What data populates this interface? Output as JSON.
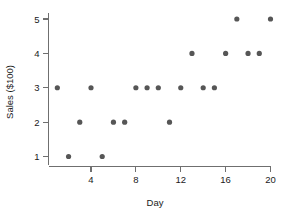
{
  "chart_data": {
    "type": "scatter",
    "title": "",
    "xlabel": "Day",
    "ylabel": "Sales ($100)",
    "x": [
      1,
      2,
      3,
      4,
      5,
      6,
      7,
      8,
      9,
      10,
      11,
      12,
      13,
      14,
      15,
      16,
      17,
      18,
      19,
      20
    ],
    "values": [
      3,
      1,
      2,
      3,
      1,
      2,
      2,
      3,
      3,
      3,
      2,
      3,
      4,
      3,
      3,
      4,
      5,
      4,
      4,
      5
    ],
    "points": [
      {
        "x": 1,
        "y": 3
      },
      {
        "x": 2,
        "y": 1
      },
      {
        "x": 3,
        "y": 2
      },
      {
        "x": 4,
        "y": 3
      },
      {
        "x": 5,
        "y": 1
      },
      {
        "x": 6,
        "y": 2
      },
      {
        "x": 7,
        "y": 2
      },
      {
        "x": 8,
        "y": 3
      },
      {
        "x": 9,
        "y": 3
      },
      {
        "x": 10,
        "y": 3
      },
      {
        "x": 11,
        "y": 2
      },
      {
        "x": 12,
        "y": 3
      },
      {
        "x": 13,
        "y": 4
      },
      {
        "x": 14,
        "y": 3
      },
      {
        "x": 15,
        "y": 3
      },
      {
        "x": 16,
        "y": 4
      },
      {
        "x": 17,
        "y": 5
      },
      {
        "x": 18,
        "y": 4
      },
      {
        "x": 19,
        "y": 4
      },
      {
        "x": 20,
        "y": 5
      }
    ],
    "xlim": [
      0.4,
      20.4
    ],
    "ylim": [
      0.55,
      5.45
    ],
    "xticks": [
      4,
      8,
      12,
      16,
      20
    ],
    "xticklabels": [
      "4",
      "8",
      "12",
      "16",
      "20"
    ],
    "yticks": [
      1,
      2,
      3,
      4,
      5
    ],
    "yticklabels": [
      "1",
      "2",
      "3",
      "4",
      "5"
    ],
    "grid": false,
    "legend": false,
    "marker": "circle",
    "marker_color": "#565656",
    "axis_color": "#6f6f6f",
    "background_color": "#ffffff"
  }
}
